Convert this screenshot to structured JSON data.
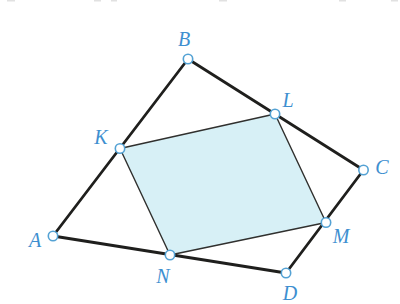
{
  "colors": {
    "background": "#ffffff",
    "outer_edge": "#1f1f1d",
    "inner_edge": "#30302e",
    "parallelogram_fill": "#d7f0f6",
    "marker_fill": "#ffffff",
    "marker_stroke": "#54a2d4",
    "label_text": "#3e8fd0",
    "artifact_gray": "#c9c9c9"
  },
  "shapes": {
    "outer_quadrilateral_points": "53,236 188,59 363.5,170 286,273",
    "inner_parallelogram_points": "120,148.5 275,114 326,222.5 170,255"
  },
  "points": [
    {
      "label": "A",
      "x": 53,
      "y": 236,
      "label_x": 35,
      "label_y": 247
    },
    {
      "label": "B",
      "x": 188,
      "y": 59,
      "label_x": 184,
      "label_y": 46
    },
    {
      "label": "C",
      "x": 363.5,
      "y": 170,
      "label_x": 382,
      "label_y": 174
    },
    {
      "label": "D",
      "x": 286,
      "y": 273,
      "label_x": 290,
      "label_y": 300
    },
    {
      "label": "K",
      "x": 120,
      "y": 148.5,
      "label_x": 101,
      "label_y": 144
    },
    {
      "label": "L",
      "x": 275,
      "y": 114,
      "label_x": 288,
      "label_y": 107
    },
    {
      "label": "M",
      "x": 326,
      "y": 222.5,
      "label_x": 341,
      "label_y": 243
    },
    {
      "label": "N",
      "x": 170,
      "y": 255,
      "label_x": 163,
      "label_y": 283
    }
  ]
}
